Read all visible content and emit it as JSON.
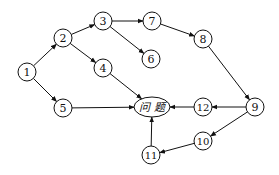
{
  "diagram": {
    "type": "directed-graph",
    "nodes": [
      {
        "id": "1",
        "label": "1",
        "x": 27,
        "y": 72
      },
      {
        "id": "2",
        "label": "2",
        "x": 63,
        "y": 38
      },
      {
        "id": "3",
        "label": "3",
        "x": 103,
        "y": 21
      },
      {
        "id": "4",
        "label": "4",
        "x": 103,
        "y": 68
      },
      {
        "id": "5",
        "label": "5",
        "x": 63,
        "y": 108
      },
      {
        "id": "6",
        "label": "6",
        "x": 151,
        "y": 59
      },
      {
        "id": "7",
        "label": "7",
        "x": 152,
        "y": 21
      },
      {
        "id": "8",
        "label": "8",
        "x": 203,
        "y": 39
      },
      {
        "id": "9",
        "label": "9",
        "x": 255,
        "y": 107
      },
      {
        "id": "10",
        "label": "10",
        "x": 203,
        "y": 141
      },
      {
        "id": "11",
        "label": "11",
        "x": 151,
        "y": 155
      },
      {
        "id": "12",
        "label": "12",
        "x": 203,
        "y": 107
      },
      {
        "id": "problem",
        "label": "问 题",
        "x": 152,
        "y": 107,
        "shape": "ellipse"
      }
    ],
    "edges": [
      {
        "from": "1",
        "to": "2"
      },
      {
        "from": "1",
        "to": "5"
      },
      {
        "from": "2",
        "to": "3"
      },
      {
        "from": "2",
        "to": "4"
      },
      {
        "from": "3",
        "to": "7"
      },
      {
        "from": "3",
        "to": "6"
      },
      {
        "from": "7",
        "to": "8"
      },
      {
        "from": "8",
        "to": "9"
      },
      {
        "from": "4",
        "to": "problem"
      },
      {
        "from": "5",
        "to": "problem"
      },
      {
        "from": "9",
        "to": "12"
      },
      {
        "from": "12",
        "to": "problem"
      },
      {
        "from": "9",
        "to": "10"
      },
      {
        "from": "10",
        "to": "11"
      },
      {
        "from": "11",
        "to": "problem"
      }
    ]
  }
}
